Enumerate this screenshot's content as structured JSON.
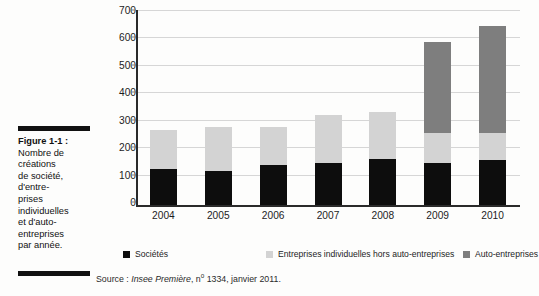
{
  "figure": {
    "label": "Figure 1-1 :",
    "caption": "Nombre de créations de société, d'entreprises individuelles et d'auto-entreprises par année.",
    "caption_lines": [
      "Nombre de",
      "créations",
      "de société,",
      "d'entre-",
      "prises",
      "individuelles",
      "et d'auto-",
      "entreprises",
      "par année."
    ]
  },
  "source": {
    "prefix": "Source : ",
    "publication": "Insee Première",
    "separator": ", n",
    "superscript": "o",
    "issue": " 1334, janvier 2011."
  },
  "colors": {
    "societes": "#0d0d0d",
    "entreprises_individuelles": "#d3d3d3",
    "auto_entreprises": "#7e7e7e",
    "gridline": "#d6d6d6",
    "axis": "#2a2a2a"
  },
  "chart_data": {
    "type": "bar",
    "subtype": "stacked",
    "title": "",
    "xlabel": "",
    "ylabel": "",
    "categories": [
      "2004",
      "2005",
      "2006",
      "2007",
      "2008",
      "2009",
      "2010"
    ],
    "yticks": [
      0,
      100,
      200,
      300,
      400,
      500,
      600,
      700
    ],
    "ylim": [
      0,
      700
    ],
    "grid": true,
    "legend_position": "bottom",
    "series": [
      {
        "name": "Sociétés",
        "color": "#0d0d0d",
        "values": [
          130,
          124,
          145,
          155,
          167,
          152,
          163
        ]
      },
      {
        "name": "Entreprises individuelles hors auto-entreprises",
        "color": "#d3d3d3",
        "values": [
          144,
          160,
          138,
          173,
          172,
          110,
          100
        ]
      },
      {
        "name": "Auto-entreprises",
        "color": "#7e7e7e",
        "values": [
          0,
          0,
          0,
          0,
          0,
          333,
          390
        ]
      }
    ],
    "totals": [
      274,
      284,
      283,
      328,
      339,
      595,
      653
    ]
  }
}
